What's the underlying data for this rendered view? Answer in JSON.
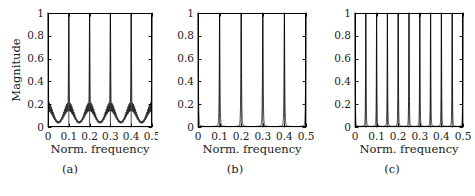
{
  "figure": {
    "background": "#ffffff",
    "line_color": "#000000",
    "axis_color": "#000000",
    "text_color": "#1a1a1a"
  },
  "panels": [
    {
      "id": "a",
      "caption": "(a)",
      "ylabel": "Magnitude",
      "xlabel": "Norm. frequency",
      "show_ylabel": true,
      "yticks": [
        "0",
        "0.2",
        "0.4",
        "0.6",
        "0.8",
        "1"
      ],
      "xticks": [
        "0",
        "0.1",
        "0.2",
        "0.3",
        "0.4",
        "0.5"
      ]
    },
    {
      "id": "b",
      "caption": "(b)",
      "ylabel": "",
      "xlabel": "Norm. frequency",
      "show_ylabel": false,
      "yticks": [
        "0",
        "0.2",
        "0.4",
        "0.6",
        "0.8",
        "1"
      ],
      "xticks": [
        "0",
        "0.1",
        "0.2",
        "0.3",
        "0.4",
        "0.5"
      ]
    },
    {
      "id": "c",
      "caption": "(c)",
      "ylabel": "",
      "xlabel": "Norm. frequency",
      "show_ylabel": false,
      "yticks": [
        "0",
        "0.2",
        "0.4",
        "0.6",
        "0.8",
        "1"
      ],
      "xticks": [
        "0",
        "0.1",
        "0.2",
        "0.3",
        "0.4",
        "0.5"
      ]
    }
  ],
  "chart_data": [
    {
      "type": "line",
      "panel": "a",
      "title": "(a)",
      "xlabel": "Norm. frequency",
      "ylabel": "Magnitude",
      "xlim": [
        0,
        0.5
      ],
      "ylim": [
        0,
        1
      ],
      "xticks": [
        0,
        0.1,
        0.2,
        0.3,
        0.4,
        0.5
      ],
      "yticks": [
        0,
        0.2,
        0.4,
        0.6,
        0.8,
        1
      ],
      "grid": false,
      "legend": null,
      "description": "Magnitude spectrum of a pulse train: sharp unity peaks at every 0.1 in normalized frequency with strongly rippling sidelobe floor whose envelope rises to about 0.22 near each peak and dips to about 0.05 midway between peaks.",
      "peak_positions": [
        0.0,
        0.1,
        0.2,
        0.3,
        0.4,
        0.5
      ],
      "peak_values": [
        1.0,
        1.0,
        1.0,
        1.0,
        1.0,
        1.0
      ],
      "peak_half_width": 0.0035,
      "sidelobe_envelope_max": 0.22,
      "sidelobe_envelope_min": 0.05,
      "sidelobe_ripple_count_per_period": 22,
      "sidelobe_ripple_depth": 0.09
    },
    {
      "type": "line",
      "panel": "b",
      "title": "(b)",
      "xlabel": "Norm. frequency",
      "ylabel": "",
      "xlim": [
        0,
        0.5
      ],
      "ylim": [
        0,
        1
      ],
      "xticks": [
        0,
        0.1,
        0.2,
        0.3,
        0.4,
        0.5
      ],
      "yticks": [
        0,
        0.2,
        0.4,
        0.6,
        0.8,
        1
      ],
      "grid": false,
      "legend": null,
      "description": "Magnitude spectrum with unity peaks at every 0.1 in normalized frequency; smooth, flared peak skirts and a near-zero flat floor with no visible sidelobe ripple.",
      "peak_positions": [
        0.0,
        0.1,
        0.2,
        0.3,
        0.4,
        0.5
      ],
      "peak_values": [
        1.0,
        1.0,
        1.0,
        1.0,
        1.0,
        1.0
      ],
      "peak_half_width": 0.003,
      "sidelobe_envelope_max": 0.03,
      "sidelobe_envelope_min": 0.004,
      "sidelobe_ripple_count_per_period": 0,
      "sidelobe_ripple_depth": 0.0
    },
    {
      "type": "line",
      "panel": "c",
      "title": "(c)",
      "xlabel": "Norm. frequency",
      "ylabel": "",
      "xlim": [
        0,
        0.5
      ],
      "ylim": [
        0,
        1
      ],
      "xticks": [
        0,
        0.1,
        0.2,
        0.3,
        0.4,
        0.5
      ],
      "yticks": [
        0,
        0.2,
        0.4,
        0.6,
        0.8,
        1
      ],
      "grid": false,
      "legend": null,
      "description": "Magnitude spectrum with eleven unity peaks spaced every 0.05 in normalized frequency; narrow peaks with flared bases and a thick near-zero floor between them.",
      "peak_positions": [
        0.0,
        0.05,
        0.1,
        0.15,
        0.2,
        0.25,
        0.3,
        0.35,
        0.4,
        0.45,
        0.5
      ],
      "peak_values": [
        1.0,
        1.0,
        1.0,
        1.0,
        1.0,
        1.0,
        1.0,
        1.0,
        1.0,
        1.0,
        1.0
      ],
      "peak_half_width": 0.0022,
      "sidelobe_envelope_max": 0.035,
      "sidelobe_envelope_min": 0.006,
      "sidelobe_ripple_count_per_period": 0,
      "sidelobe_ripple_depth": 0.0
    }
  ]
}
